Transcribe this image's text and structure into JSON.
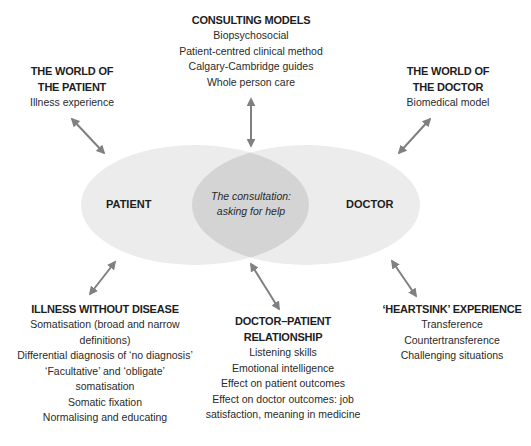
{
  "diagram": {
    "colors": {
      "ellipse_fill": "#ececec",
      "overlap_fill": "#d4d4d4",
      "arrow": "#808080",
      "text": "#222222"
    },
    "circles": {
      "left": "PATIENT",
      "right": "DOCTOR",
      "overlap_line1": "The consultation:",
      "overlap_line2": "asking for help"
    },
    "blocks": {
      "consulting_models": {
        "title": "CONSULTING MODELS",
        "items": [
          "Biopsychosocial",
          "Patient-centred clinical method",
          "Calgary-Cambridge guides",
          "Whole person care"
        ]
      },
      "world_of_patient": {
        "title_line1": "THE WORLD OF",
        "title_line2": "THE PATIENT",
        "items": [
          "Illness experience"
        ]
      },
      "world_of_doctor": {
        "title_line1": "THE WORLD OF",
        "title_line2": "THE DOCTOR",
        "items": [
          "Biomedical model"
        ]
      },
      "illness_without_disease": {
        "title": "ILLNESS WITHOUT DISEASE",
        "items": [
          "Somatisation (broad and narrow",
          "definitions)",
          "Differential diagnosis of ‘no diagnosis’",
          "‘Facultative’ and ‘obligate’",
          "somatisation",
          "Somatic fixation",
          "Normalising and educating"
        ]
      },
      "doctor_patient_relationship": {
        "title_line1": "DOCTOR–PATIENT",
        "title_line2": "RELATIONSHIP",
        "items": [
          "Listening skills",
          "Emotional intelligence",
          "Effect on patient outcomes",
          "Effect on doctor outcomes: job",
          "satisfaction, meaning in medicine"
        ]
      },
      "heartsink_experience": {
        "title": "‘HEARTSINK’ EXPERIENCE",
        "items": [
          "Transference",
          "Countertransference",
          "Challenging situations"
        ]
      }
    }
  }
}
